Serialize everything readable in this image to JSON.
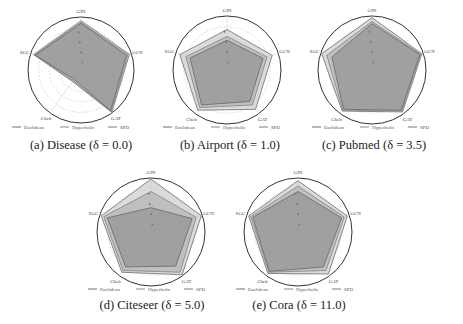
{
  "figure": {
    "captions": [
      "(a) Disease (δ = 0.0)",
      "(b) Airport (δ = 1.0)",
      "(c) Pubmed (δ = 3.5)",
      "(d) Citeseer (δ = 5.0)",
      "(e) Cora (δ = 11.0)"
    ]
  },
  "legend": {
    "items": [
      "Euclidean",
      "Hyperbolic",
      "SPD"
    ]
  },
  "chart_data": [
    {
      "type": "radar",
      "title": "(a) Disease (δ = 0.0)",
      "dataset": "Disease",
      "delta": 0.0,
      "axes": [
        "GIN",
        "GCN",
        "GAT",
        "Cheb",
        "SGC"
      ],
      "series": [
        {
          "name": "Euclidean",
          "values": [
            0.88,
            0.9,
            0.95,
            0.22,
            0.9
          ]
        },
        {
          "name": "Hyperbolic",
          "values": [
            0.9,
            0.93,
            0.97,
            0.25,
            0.92
          ]
        },
        {
          "name": "SPD",
          "values": [
            0.93,
            0.96,
            0.99,
            0.27,
            0.94
          ]
        }
      ],
      "grid": true,
      "legend_position": "bottom"
    },
    {
      "type": "radar",
      "title": "(b) Airport (δ = 1.0)",
      "dataset": "Airport",
      "delta": 1.0,
      "axes": [
        "GIN",
        "GCN",
        "GAT",
        "Cheb",
        "SGC"
      ],
      "series": [
        {
          "name": "Euclidean",
          "values": [
            0.55,
            0.7,
            0.72,
            0.8,
            0.72
          ]
        },
        {
          "name": "Hyperbolic",
          "values": [
            0.62,
            0.78,
            0.8,
            0.86,
            0.8
          ]
        },
        {
          "name": "SPD",
          "values": [
            0.75,
            0.88,
            0.9,
            0.92,
            0.92
          ]
        }
      ],
      "grid": true,
      "legend_position": "bottom"
    },
    {
      "type": "radar",
      "title": "(c) Pubmed (δ = 3.5)",
      "dataset": "Pubmed",
      "delta": 3.5,
      "axes": [
        "GIN",
        "GCN",
        "GAT",
        "Cheb",
        "SGC"
      ],
      "series": [
        {
          "name": "Euclidean",
          "values": [
            0.86,
            0.93,
            0.92,
            0.9,
            0.78
          ]
        },
        {
          "name": "Hyperbolic",
          "values": [
            0.9,
            0.95,
            0.94,
            0.92,
            0.88
          ]
        },
        {
          "name": "SPD",
          "values": [
            0.97,
            0.97,
            0.96,
            0.94,
            0.98
          ]
        }
      ],
      "grid": true,
      "legend_position": "bottom"
    },
    {
      "type": "radar",
      "title": "(d) Citeseer (δ = 5.0)",
      "dataset": "Citeseer",
      "delta": 5.0,
      "axes": [
        "GIN",
        "GCN",
        "GAT",
        "Cheb",
        "SGC"
      ],
      "series": [
        {
          "name": "Euclidean",
          "values": [
            0.45,
            0.8,
            0.78,
            0.8,
            0.85
          ]
        },
        {
          "name": "Hyperbolic",
          "values": [
            0.75,
            0.88,
            0.92,
            0.88,
            0.92
          ]
        },
        {
          "name": "SPD",
          "values": [
            0.98,
            0.98,
            0.98,
            0.92,
            0.97
          ]
        }
      ],
      "grid": true,
      "legend_position": "bottom"
    },
    {
      "type": "radar",
      "title": "(e) Cora (δ = 11.0)",
      "dataset": "Cora",
      "delta": 11.0,
      "axes": [
        "GIN",
        "GCN",
        "GAT",
        "Cheb",
        "SGC"
      ],
      "series": [
        {
          "name": "Euclidean",
          "values": [
            0.75,
            0.85,
            0.8,
            0.9,
            0.88
          ]
        },
        {
          "name": "Hyperbolic",
          "values": [
            0.85,
            0.9,
            0.88,
            0.92,
            0.92
          ]
        },
        {
          "name": "SPD",
          "values": [
            0.95,
            0.96,
            0.96,
            0.95,
            0.96
          ]
        }
      ],
      "grid": true,
      "legend_position": "bottom"
    }
  ]
}
